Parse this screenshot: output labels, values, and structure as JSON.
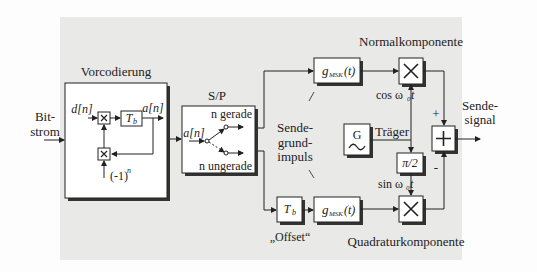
{
  "diagram": {
    "input_label": [
      "Bit-",
      "strom"
    ],
    "output_label": [
      "Sende-",
      "signal"
    ],
    "precoding": {
      "title": "Vorcodierung",
      "input": "d[n]",
      "output": "a[n]",
      "delay": "T",
      "delay_sub": "b",
      "factor": "(-1)",
      "factor_sup": "n"
    },
    "sp_converter": {
      "title": "S/P",
      "input": "a[n]",
      "even_label": "n gerade",
      "odd_label": "n ungerade"
    },
    "pulse_shaper": {
      "label": "g",
      "label_sub": "MSK",
      "label_arg": "(t)",
      "annotation": [
        "Sende-",
        "grund-",
        "impuls"
      ]
    },
    "offset": {
      "delay": "T",
      "delay_sub": "b",
      "label": "„Offset“"
    },
    "carrier": {
      "generator": "G",
      "label": "Träger",
      "cos": "cos ω",
      "sin": "sin ω",
      "sub": "0",
      "t": "t",
      "phase_shift": "π/2"
    },
    "components": {
      "normal": "Normalkomponente",
      "quadrature": "Quadraturkomponente"
    },
    "summer": {
      "plus": "+",
      "minus": "-"
    }
  },
  "colors": {
    "background": "#e9e9e8",
    "box_fill": "#ffffff",
    "line": "#222222",
    "shadow": "#333333"
  }
}
